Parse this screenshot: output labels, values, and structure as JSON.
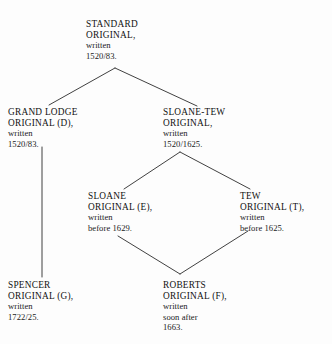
{
  "diagram": {
    "background_color": "#fdfdfd",
    "line_color": "#2b2b2b",
    "text_color": "#1b1b1b",
    "nodes": {
      "standard": {
        "line1": "STANDARD",
        "line2": "ORIGINAL,",
        "line3": "written",
        "line4": "1520/83."
      },
      "grand_lodge": {
        "line1": "GRAND LODGE",
        "line2": "ORIGINAL (D),",
        "line3": "written",
        "line4": "1520/83."
      },
      "sloane_tew": {
        "line1": "SLOANE-TEW",
        "line2": "ORIGINAL,",
        "line3": "written",
        "line4": "1520/1625."
      },
      "sloane": {
        "line1": "SLOANE",
        "line2": "ORIGINAL (E),",
        "line3": "written",
        "line4": "before 1629."
      },
      "tew": {
        "line1": "TEW",
        "line2": "ORIGINAL (T),",
        "line3": "written",
        "line4": "before 1625."
      },
      "spencer": {
        "line1": "SPENCER",
        "line2": "ORIGINAL (G),",
        "line3": "written",
        "line4": "1722/25."
      },
      "roberts": {
        "line1": "ROBERTS",
        "line2": "ORIGINAL (F),",
        "line3": "written",
        "line4": "soon after",
        "line5": "1663."
      }
    },
    "edges": [
      {
        "name": "standard-to-grand-lodge",
        "from": "standard",
        "to": "grand_lodge",
        "points": "115,68 49,105"
      },
      {
        "name": "standard-to-sloane-tew",
        "from": "standard",
        "to": "sloane_tew",
        "points": "115,68 197,106"
      },
      {
        "name": "sloane-tew-to-sloane",
        "from": "sloane_tew",
        "to": "sloane",
        "points": "180,152 124,189"
      },
      {
        "name": "sloane-tew-to-tew",
        "from": "sloane_tew",
        "to": "tew",
        "points": "180,152 250,189"
      },
      {
        "name": "grand-lodge-to-spencer",
        "from": "grand_lodge",
        "to": "spencer",
        "points": "42,147 42,277"
      },
      {
        "name": "sloane-to-roberts",
        "from": "sloane",
        "to": "roberts",
        "points": "118,236 180,274"
      },
      {
        "name": "tew-to-roberts",
        "from": "tew",
        "to": "roberts",
        "points": "248,231 180,274"
      }
    ]
  }
}
